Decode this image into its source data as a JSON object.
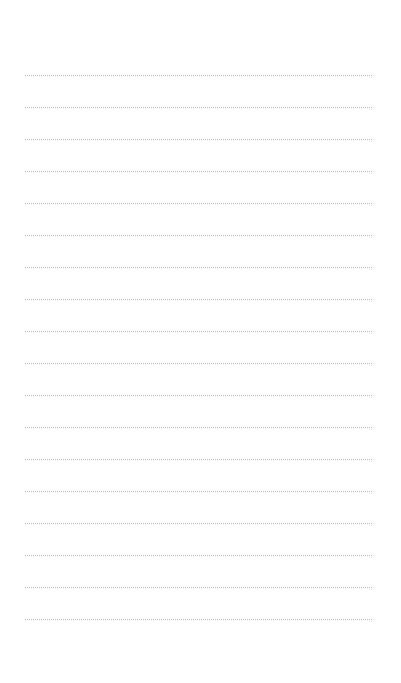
{
  "page": {
    "type": "lined-notepad",
    "background_color": "#ffffff",
    "line_color": "#b8b8b8",
    "line_style": "dotted",
    "line_left": 25,
    "line_width": 347,
    "first_line_y": 75,
    "line_spacing": 32,
    "line_count": 18
  },
  "lines": [
    {
      "text": ""
    },
    {
      "text": ""
    },
    {
      "text": ""
    },
    {
      "text": ""
    },
    {
      "text": ""
    },
    {
      "text": ""
    },
    {
      "text": ""
    },
    {
      "text": ""
    },
    {
      "text": ""
    },
    {
      "text": ""
    },
    {
      "text": ""
    },
    {
      "text": ""
    },
    {
      "text": ""
    },
    {
      "text": ""
    },
    {
      "text": ""
    },
    {
      "text": ""
    },
    {
      "text": ""
    },
    {
      "text": ""
    }
  ]
}
